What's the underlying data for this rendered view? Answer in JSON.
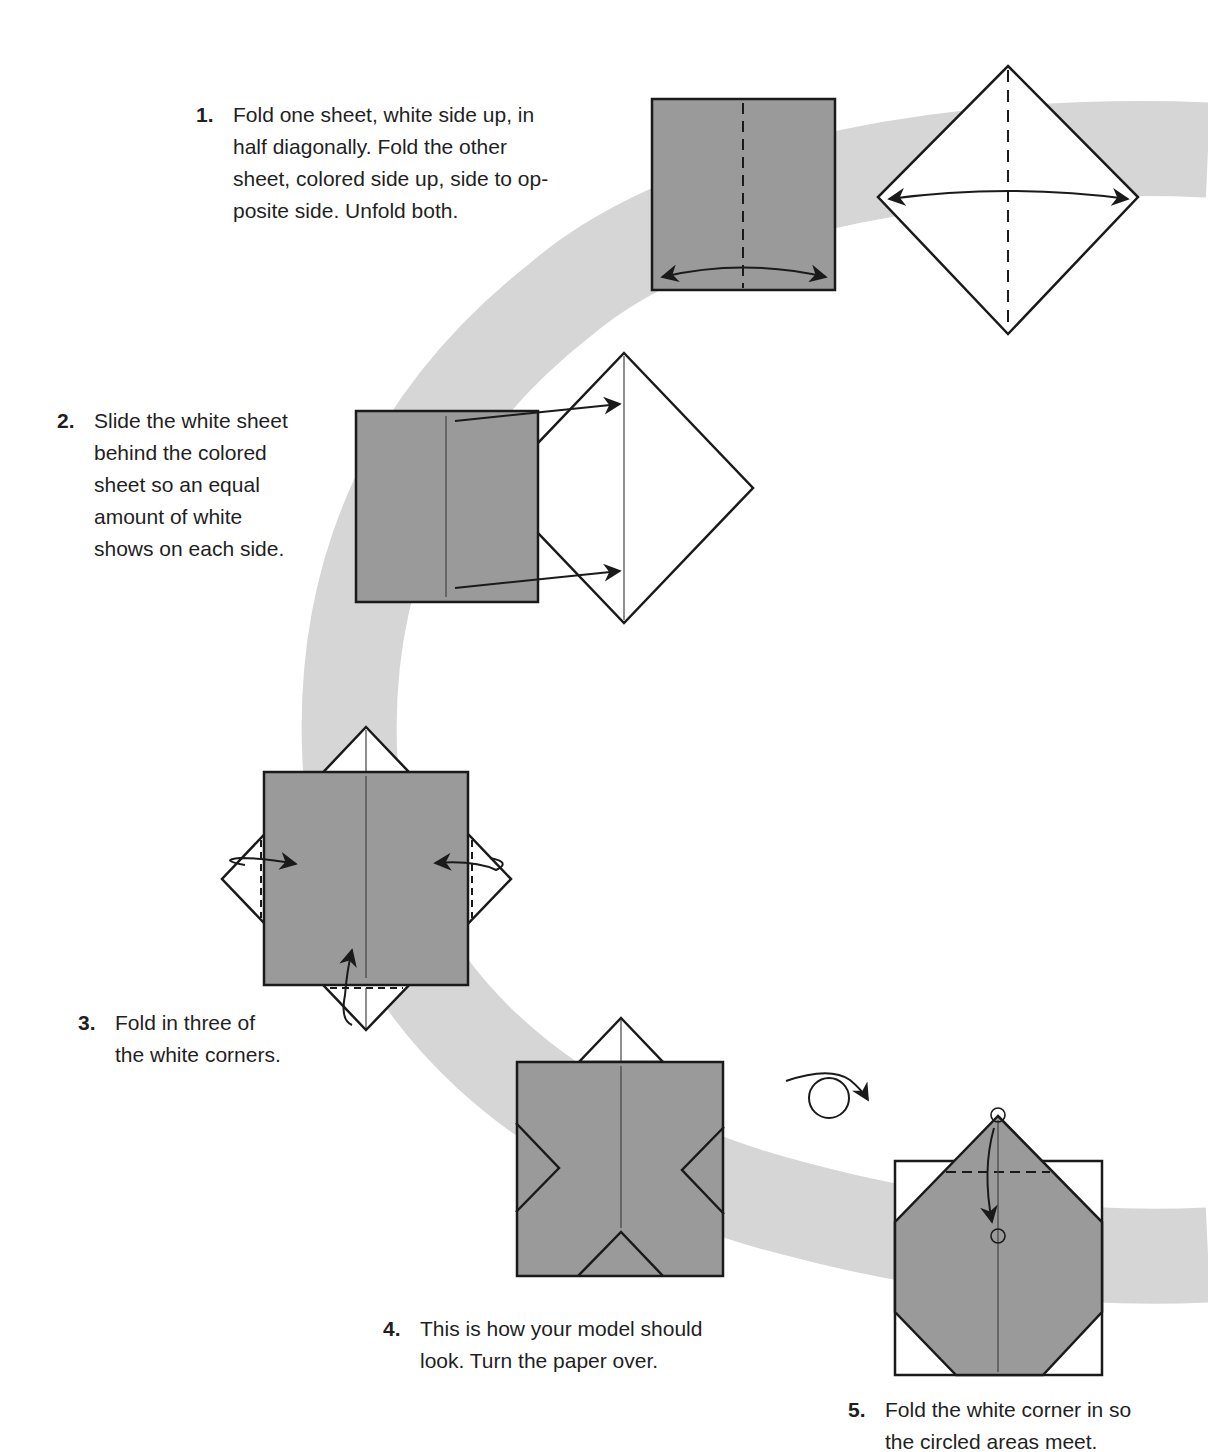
{
  "colors": {
    "paper_colored": "#9a9a9a",
    "band": "#d6d6d6",
    "line": "#1a1a1a",
    "background": "#ffffff"
  },
  "steps": [
    {
      "number": "1.",
      "text": "Fold one sheet, white side up, in\nhalf diagonally. Fold the other\nsheet, colored side up, side to op-\nposite side. Unfold both."
    },
    {
      "number": "2.",
      "text": "Slide the white sheet\nbehind the colored\nsheet so an equal\namount of white\nshows on each side."
    },
    {
      "number": "3.",
      "text": "Fold in three of\nthe white corners."
    },
    {
      "number": "4.",
      "text": "This is how your model should\nlook. Turn the paper over."
    },
    {
      "number": "5.",
      "text": "Fold the white corner in so\nthe circled areas meet."
    }
  ],
  "icons": {
    "valley_fold_line": "dashed-line",
    "fold_unfold_arrow": "double-headed-arc-arrow",
    "slide_arrow": "straight-arrow",
    "tuck_arrow": "curled-arrow",
    "turn_over": "loop-arrow",
    "meet_point": "circle-marker"
  }
}
